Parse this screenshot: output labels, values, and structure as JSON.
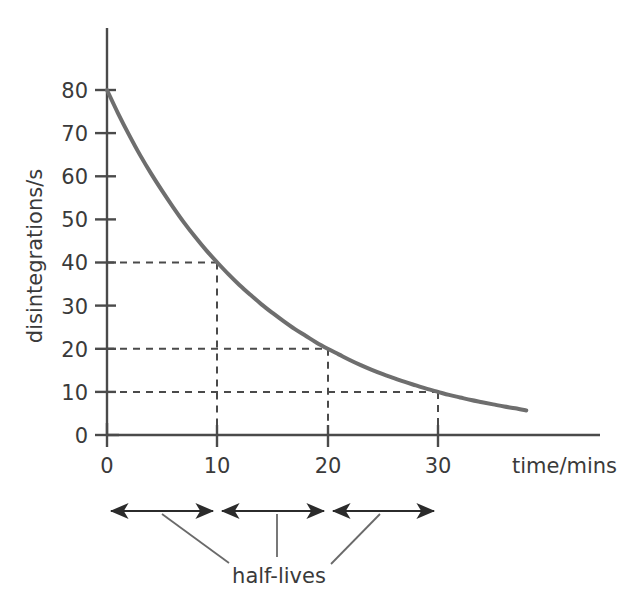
{
  "chart_data": {
    "type": "line",
    "title": "",
    "subtitle": "",
    "xlabel": "time/mins",
    "ylabel": "disintegrations/s",
    "xlim": [
      0,
      38
    ],
    "ylim": [
      0,
      88
    ],
    "grid": false,
    "legend": null,
    "x_ticks": [
      0,
      10,
      20,
      30
    ],
    "x_tick_labels": [
      "0",
      "10",
      "20",
      "30"
    ],
    "y_ticks": [
      0,
      10,
      20,
      30,
      40,
      50,
      60,
      70,
      80
    ],
    "y_tick_labels": [
      "0",
      "10",
      "20",
      "30",
      "40",
      "50",
      "60",
      "70",
      "80"
    ],
    "series": [
      {
        "name": "activity",
        "style": "solid",
        "color": "#6e6e6e",
        "x": [
          0,
          1,
          2,
          3,
          4,
          5,
          6,
          7,
          8,
          9,
          10,
          11,
          12,
          13,
          14,
          15,
          16,
          17,
          18,
          19,
          20,
          21,
          22,
          23,
          24,
          25,
          26,
          27,
          28,
          29,
          30,
          31,
          32,
          33,
          34,
          35,
          36,
          37,
          38
        ],
        "y": [
          80,
          74.6,
          69.6,
          64.9,
          60.6,
          56.6,
          52.8,
          49.2,
          45.9,
          42.8,
          40,
          37.3,
          34.8,
          32.5,
          30.3,
          28.3,
          26.4,
          24.6,
          23,
          21.4,
          20,
          18.7,
          17.4,
          16.2,
          15.1,
          14.1,
          13.2,
          12.3,
          11.5,
          10.7,
          10,
          9.3,
          8.7,
          8.1,
          7.6,
          7.1,
          6.6,
          6.2,
          5.7
        ]
      }
    ],
    "annotations": {
      "construction_lines": [
        {
          "type": "horizontal",
          "y": 40,
          "from_x": 0,
          "to_x": 10,
          "style": "dashed"
        },
        {
          "type": "vertical",
          "x": 10,
          "from_y": 0,
          "to_y": 40,
          "style": "dashed"
        },
        {
          "type": "horizontal",
          "y": 20,
          "from_x": 0,
          "to_x": 20,
          "style": "dashed"
        },
        {
          "type": "vertical",
          "x": 20,
          "from_y": 0,
          "to_y": 20,
          "style": "dashed"
        },
        {
          "type": "horizontal",
          "y": 10,
          "from_x": 0,
          "to_x": 30,
          "style": "dashed"
        },
        {
          "type": "vertical",
          "x": 30,
          "from_y": 0,
          "to_y": 10,
          "style": "dashed"
        }
      ],
      "half_life_spans": [
        {
          "from_x": 0,
          "to_x": 10
        },
        {
          "from_x": 10,
          "to_x": 20
        },
        {
          "from_x": 20,
          "to_x": 30
        }
      ],
      "half_lives_label": "half-lives"
    }
  },
  "labels": {
    "y_axis_title": "disintegrations/s",
    "x_axis_title": "time/mins",
    "half_lives": "half-lives"
  },
  "colors": {
    "curve": "#6e6e6e",
    "axis": "#4a4a4a",
    "dashed": "#4a4a4a",
    "text": "#3a3a3a",
    "arrow": "#2b2b2b",
    "background": "#ffffff"
  }
}
